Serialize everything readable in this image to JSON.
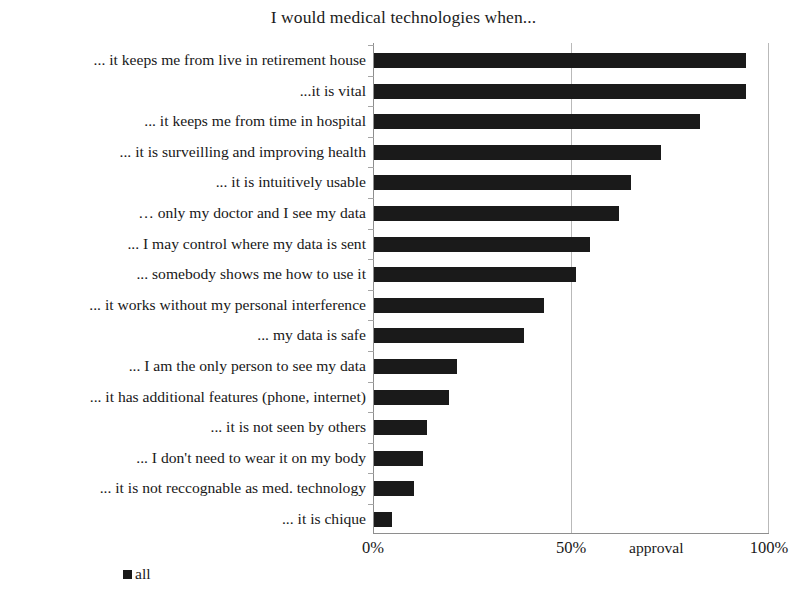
{
  "chart_data": {
    "type": "bar",
    "orientation": "horizontal",
    "title": "I would medical technologies when...",
    "xlabel": "approval",
    "ylabel": "",
    "xlim": [
      0,
      100
    ],
    "xticks": [
      "0%",
      "50%",
      "100%"
    ],
    "xtick_values": [
      0,
      50,
      100
    ],
    "grid": true,
    "legend": {
      "position": "bottom-left",
      "entries": [
        {
          "label": "all",
          "color": "#1a1a1a"
        }
      ]
    },
    "series": [
      {
        "name": "all",
        "color": "#1a1a1a",
        "values": [
          94,
          94,
          82.5,
          72.5,
          65,
          62,
          54.5,
          51,
          43,
          38,
          21,
          19,
          13.5,
          12.5,
          10,
          4.5
        ]
      }
    ],
    "categories": [
      "... it keeps me from live in retirement house",
      "...it is vital",
      "... it keeps me from time in hospital",
      "... it is surveilling and improving health",
      "... it is intuitively usable",
      "… only my doctor and I see my data",
      "... I may control where my data is sent",
      "... somebody shows me how to use it",
      "... it works without my personal interference",
      "... my data is safe",
      "... I am the only person to see my data",
      "... it has additional features (phone, internet)",
      "... it is not seen by others",
      "... I don't need to wear it on my body",
      "... it is not reccognable as med. technology",
      "... it is chique"
    ]
  }
}
